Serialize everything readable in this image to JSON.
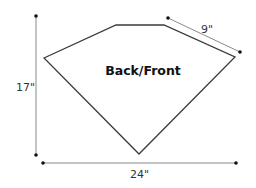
{
  "diagram": {
    "piece_label": "Back/Front",
    "shape": "pentagon pattern piece",
    "dimensions": {
      "height": "17\"",
      "width": "24\"",
      "side": "9\""
    }
  }
}
